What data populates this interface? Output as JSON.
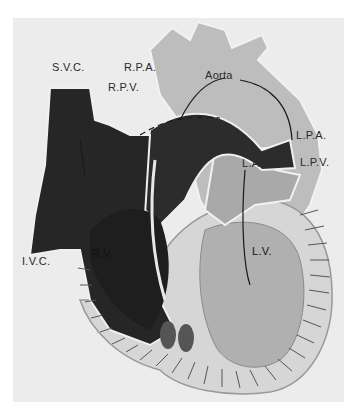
{
  "figure": {
    "labels": {
      "svc": "S.V.C.",
      "rpa": "R.P.A.",
      "rpv": "R.P.V.",
      "aorta": "Aorta",
      "lpa": "L.P.A.",
      "lpv": "L.P.V.",
      "la": "L.A.",
      "lv": "L.V.",
      "rv": "R.V.",
      "ivc": "I.V.C."
    },
    "colors": {
      "background": "#ececec",
      "deoxygenated": "#2b2b2b",
      "oxygenated": "#b8b8b8",
      "wall": "#d9d9d9",
      "outline": "#8a8a8a"
    }
  }
}
